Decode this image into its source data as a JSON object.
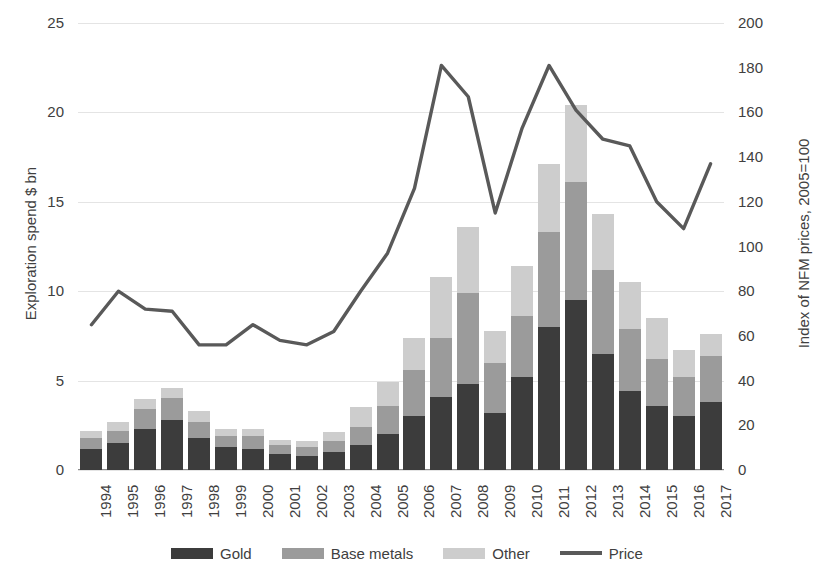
{
  "chart_data": {
    "type": "bar",
    "title": "",
    "xlabel": "",
    "ylabel": "Exploration spend $ bn",
    "y2label": "Index of NFM prices, 2005=100",
    "ylim": [
      0,
      25
    ],
    "y2lim": [
      0,
      200
    ],
    "yticks": [
      0,
      5,
      10,
      15,
      20,
      25
    ],
    "y2ticks": [
      0,
      20,
      40,
      60,
      80,
      100,
      120,
      140,
      160,
      180,
      200
    ],
    "grid": true,
    "legend_position": "bottom",
    "stacked": true,
    "categories": [
      "1994",
      "1995",
      "1996",
      "1997",
      "1998",
      "1999",
      "2000",
      "2001",
      "2002",
      "2003",
      "2004",
      "2005",
      "2006",
      "2007",
      "2008",
      "2009",
      "2010",
      "2011",
      "2012",
      "2013",
      "2014",
      "2015",
      "2016",
      "2017"
    ],
    "series": [
      {
        "name": "Gold",
        "axis": "left",
        "color": "#3c3c3c",
        "values": [
          1.2,
          1.5,
          2.3,
          2.8,
          1.8,
          1.3,
          1.2,
          0.9,
          0.8,
          1.0,
          1.4,
          2.0,
          3.0,
          4.1,
          4.8,
          3.2,
          5.2,
          8.0,
          9.5,
          6.5,
          4.4,
          3.6,
          3.0,
          3.8
        ]
      },
      {
        "name": "Base metals",
        "axis": "left",
        "color": "#9b9b9b",
        "values": [
          0.6,
          0.7,
          1.1,
          1.2,
          0.9,
          0.6,
          0.7,
          0.5,
          0.5,
          0.6,
          1.0,
          1.6,
          2.6,
          3.3,
          5.1,
          2.8,
          3.4,
          5.3,
          6.6,
          4.7,
          3.5,
          2.6,
          2.2,
          2.6
        ]
      },
      {
        "name": "Other",
        "axis": "left",
        "color": "#cdcdcd",
        "values": [
          0.4,
          0.5,
          0.6,
          0.6,
          0.6,
          0.4,
          0.4,
          0.3,
          0.3,
          0.5,
          1.1,
          1.3,
          1.8,
          3.4,
          3.7,
          1.8,
          2.8,
          3.8,
          4.3,
          3.1,
          2.6,
          2.3,
          1.5,
          1.2
        ]
      },
      {
        "name": "Price",
        "axis": "right",
        "color": "#595959",
        "type": "line",
        "values": [
          65,
          80,
          72,
          71,
          56,
          56,
          65,
          58,
          56,
          62,
          80,
          97,
          126,
          181,
          167,
          115,
          153,
          181,
          161,
          148,
          145,
          120,
          108,
          137
        ]
      }
    ]
  },
  "axes": {
    "left": {
      "title": "Exploration spend $ bn",
      "ticks": [
        "25",
        "20",
        "15",
        "10",
        "5",
        "0"
      ]
    },
    "right": {
      "title": "Index of NFM prices, 2005=100",
      "ticks": [
        "200",
        "180",
        "160",
        "140",
        "120",
        "100",
        "80",
        "60",
        "40",
        "20",
        "0"
      ]
    }
  },
  "legend": {
    "items": [
      {
        "label": "Gold",
        "color": "#3c3c3c",
        "shape": "swatch"
      },
      {
        "label": "Base metals",
        "color": "#9b9b9b",
        "shape": "swatch"
      },
      {
        "label": "Other",
        "color": "#cdcdcd",
        "shape": "swatch"
      },
      {
        "label": "Price",
        "color": "#595959",
        "shape": "line"
      }
    ]
  }
}
